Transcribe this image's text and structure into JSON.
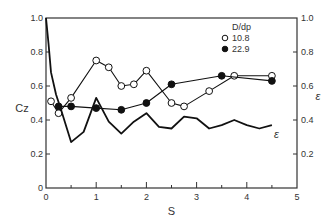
{
  "chart_data": {
    "type": "line",
    "title": "",
    "xlabel": "S",
    "ylabel": "Cz",
    "ylabel_right": "ε",
    "xlim": [
      0,
      5
    ],
    "ylim": [
      0,
      1.0
    ],
    "ylim_right": [
      0,
      1.0
    ],
    "x_ticks": [
      "0",
      "1",
      "2",
      "3",
      "4",
      "5"
    ],
    "y_ticks": [
      "0",
      "0.2",
      "0.4",
      "0.6",
      "0.8",
      "1.0"
    ],
    "y_ticks_right": [
      "0.2",
      "0.4",
      "0.6",
      "0.8",
      "1.0"
    ],
    "grid": false,
    "legend": {
      "title": "D/dp",
      "position": "upper right",
      "entries": [
        {
          "label": "10.8",
          "marker": "open-circle"
        },
        {
          "label": "22.9",
          "marker": "filled-circle"
        }
      ]
    },
    "series": [
      {
        "name": "10.8",
        "marker": "open-circle",
        "axis": "left",
        "x": [
          0.1,
          0.25,
          0.5,
          1.0,
          1.25,
          1.5,
          1.75,
          2.0,
          2.5,
          2.75,
          3.25,
          3.75,
          4.5
        ],
        "y": [
          0.51,
          0.44,
          0.53,
          0.75,
          0.71,
          0.6,
          0.61,
          0.69,
          0.5,
          0.48,
          0.57,
          0.66,
          0.66
        ]
      },
      {
        "name": "22.9",
        "marker": "filled-circle",
        "axis": "left",
        "x": [
          0.25,
          0.5,
          1.0,
          1.5,
          2.0,
          2.5,
          3.5,
          4.5
        ],
        "y": [
          0.48,
          0.48,
          0.47,
          0.46,
          0.5,
          0.61,
          0.66,
          0.63
        ]
      },
      {
        "name": "ε",
        "marker": "none",
        "axis": "right",
        "x": [
          0.0,
          0.05,
          0.1,
          0.2,
          0.3,
          0.5,
          0.75,
          1.0,
          1.25,
          1.5,
          1.75,
          2.0,
          2.25,
          2.5,
          2.75,
          3.0,
          3.25,
          3.5,
          3.75,
          4.0,
          4.25,
          4.5
        ],
        "y": [
          1.0,
          0.85,
          0.68,
          0.55,
          0.46,
          0.27,
          0.33,
          0.53,
          0.39,
          0.32,
          0.39,
          0.44,
          0.36,
          0.35,
          0.42,
          0.41,
          0.35,
          0.37,
          0.4,
          0.37,
          0.35,
          0.37
        ]
      }
    ],
    "annotations": [
      {
        "text": "ε",
        "x": 4.5,
        "y": 0.32
      }
    ]
  }
}
